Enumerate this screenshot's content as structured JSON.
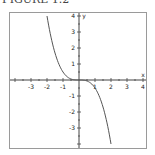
{
  "caption": "FIGURE 1.2",
  "chart_data": {
    "type": "line",
    "title": "",
    "xlabel": "x",
    "ylabel": "y",
    "xlim": [
      -4,
      4
    ],
    "ylim": [
      -4,
      4
    ],
    "xticks": [
      -3,
      -2,
      -1,
      1,
      2,
      3,
      4
    ],
    "yticks": [
      4,
      3,
      2,
      1,
      -1,
      -2,
      -3
    ],
    "grid": false,
    "legend": null,
    "series": [
      {
        "name": "y = -x^3/2",
        "color": "#555555",
        "x": [
          -2.0,
          -1.75,
          -1.5,
          -1.25,
          -1.0,
          -0.75,
          -0.5,
          -0.25,
          0.0,
          0.25,
          0.5,
          0.75,
          1.0,
          1.25,
          1.5,
          1.75,
          2.0
        ],
        "y": [
          4.0,
          2.68,
          1.69,
          0.98,
          0.5,
          0.21,
          0.06,
          0.01,
          0.0,
          -0.01,
          -0.06,
          -0.21,
          -0.5,
          -0.98,
          -1.69,
          -2.68,
          -4.0
        ]
      }
    ]
  },
  "axis": {
    "x_label": "x",
    "y_label": "y",
    "x_tick_labels": [
      "-3",
      "-2",
      "-1",
      "1",
      "2",
      "3",
      "4"
    ],
    "y_tick_labels": [
      "4",
      "3",
      "2",
      "1",
      "-1",
      "-2",
      "-3"
    ]
  }
}
